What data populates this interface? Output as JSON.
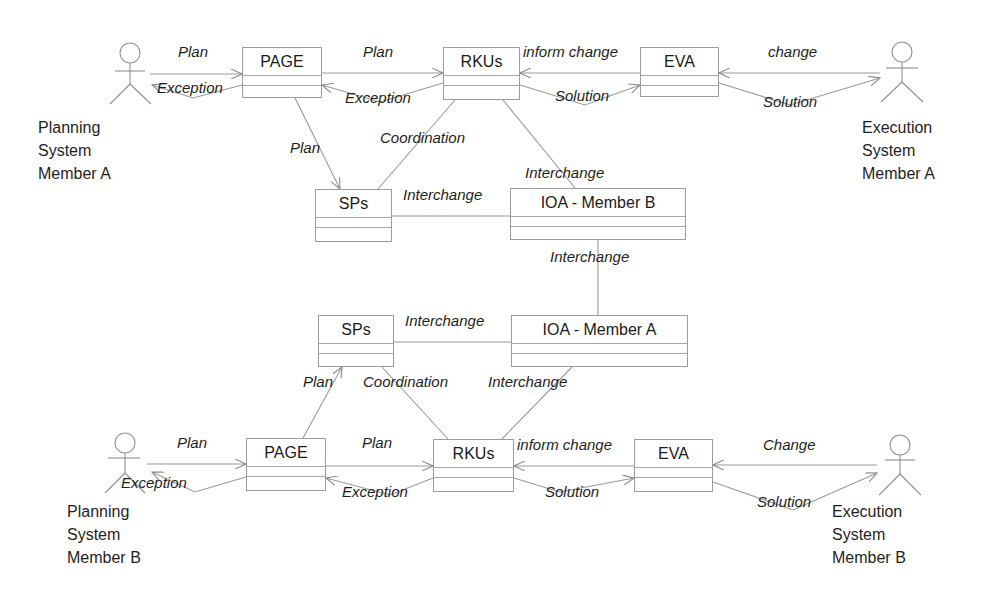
{
  "diagram": {
    "classes": {
      "page_a": "PAGE",
      "rkus_a": "RKUs",
      "eva_a": "EVA",
      "sps_b": "SPs",
      "ioa_b": "IOA - Member B",
      "sps_a": "SPs",
      "ioa_a": "IOA - Member A",
      "page_b": "PAGE",
      "rkus_b": "RKUs",
      "eva_b": "EVA"
    },
    "actors": {
      "planning_a": [
        "Planning",
        "System",
        "Member A"
      ],
      "execution_a": [
        "Execution",
        "System",
        "Member A"
      ],
      "planning_b": [
        "Planning",
        "System",
        "Member B"
      ],
      "execution_b": [
        "Execution",
        "System",
        "Member B"
      ]
    },
    "edges": {
      "top": {
        "actor_page_plan": "Plan",
        "page_actor_exception": "Exception",
        "page_rkus_plan": "Plan",
        "rkus_page_exception": "Exception",
        "eva_rkus_inform": "inform change",
        "rkus_eva_solution": "Solution",
        "actor_eva_change": "change",
        "eva_actor_solution": "Solution",
        "page_sps_plan": "Plan",
        "rkus_sps_coordination": "Coordination",
        "rkus_ioa_interchange": "Interchange",
        "sps_ioa_interchange": "Interchange"
      },
      "middle": {
        "ioa_ioa_interchange": "Interchange"
      },
      "bottom": {
        "sps_ioa_interchange": "Interchange",
        "page_sps_plan": "Plan",
        "rkus_sps_coordination": "Coordination",
        "rkus_ioa_interchange": "Interchange",
        "actor_page_plan": "Plan",
        "page_actor_exception": "Exception",
        "page_rkus_plan": "Plan",
        "rkus_page_exception": "Exception",
        "eva_rkus_inform": "inform change",
        "rkus_eva_solution": "Solution",
        "actor_eva_change": "Change",
        "eva_actor_solution": "Solution"
      }
    },
    "colors": {
      "line": "#9a9a9a",
      "text": "#1e1e1e",
      "background": "#ffffff"
    }
  }
}
